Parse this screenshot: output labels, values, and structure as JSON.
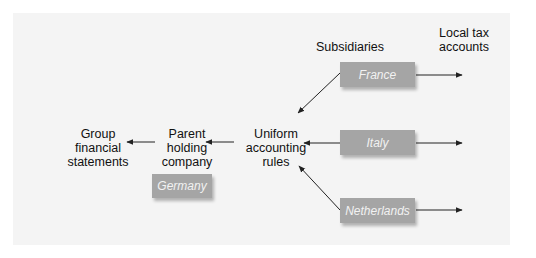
{
  "diagram": {
    "labels": {
      "group_statements": [
        "Group",
        "financial",
        "statements"
      ],
      "parent_company": [
        "Parent",
        "holding",
        "company"
      ],
      "uniform_rules": [
        "Uniform",
        "accounting",
        "rules"
      ],
      "subsidiaries_header": "Subsidiaries",
      "local_tax_header": [
        "Local tax",
        "accounts"
      ]
    },
    "parent_box": {
      "label": "Germany"
    },
    "subsidiaries": [
      {
        "label": "France"
      },
      {
        "label": "Italy"
      },
      {
        "label": "Netherlands"
      }
    ],
    "colors": {
      "panel_bg": "#f4f4f4",
      "box_fill": "#a5a5a5",
      "box_text": "#f2f2f2",
      "arrow": "#222222"
    }
  }
}
